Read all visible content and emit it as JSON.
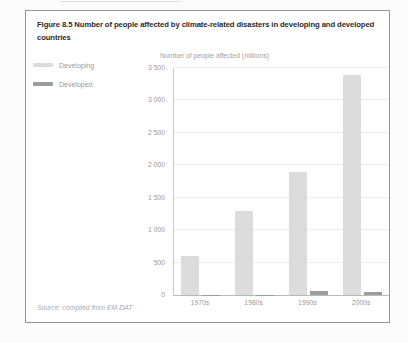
{
  "figure": {
    "title": "Figure 8.5 Number of people affected by climate-related disasters in developing and developed countries",
    "source": "Source: compiled from EM-DAT"
  },
  "legend": {
    "items": [
      {
        "label": "Developing",
        "color": "#dcdcdc"
      },
      {
        "label": "Developed",
        "color": "#9c9c9c"
      }
    ]
  },
  "chart_data": {
    "type": "bar",
    "title": "",
    "axis_title": "Number of people affected (millions)",
    "categories": [
      "1970s",
      "1980s",
      "1990s",
      "2000s"
    ],
    "series": [
      {
        "name": "Developing",
        "color": "#dcdcdc",
        "values": [
          600,
          1300,
          1900,
          3400
        ]
      },
      {
        "name": "Developed",
        "color": "#9c9c9c",
        "values": [
          5,
          5,
          60,
          40
        ]
      }
    ],
    "ylim": [
      0,
      3500
    ],
    "yticks": [
      {
        "value": 0,
        "label": "0"
      },
      {
        "value": 500,
        "label": "500"
      },
      {
        "value": 1000,
        "label": "1 000"
      },
      {
        "value": 1500,
        "label": "1 500"
      },
      {
        "value": 2000,
        "label": "2 000"
      },
      {
        "value": 2500,
        "label": "2 500"
      },
      {
        "value": 3000,
        "label": "3 000"
      },
      {
        "value": 3500,
        "label": "3 500"
      }
    ],
    "grid": true,
    "legend_position": "left"
  }
}
